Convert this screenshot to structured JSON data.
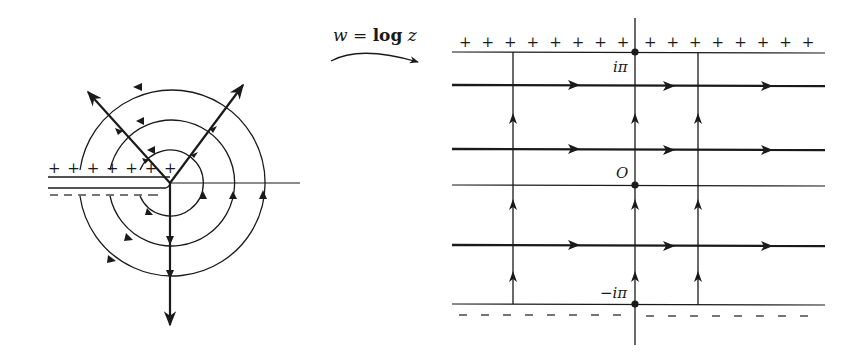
{
  "diagram": {
    "colors": {
      "ink": "#1a1a1a",
      "background": "#ffffff"
    }
  },
  "mapping": {
    "label_w": "w",
    "label_eq": " = ",
    "label_log": "log",
    "label_z": "z"
  },
  "z_plane": {
    "center": [
      170,
      183
    ],
    "circle_radii": [
      33,
      63,
      93
    ],
    "rays": [
      {
        "name": "upper-left-ray",
        "to": [
          88,
          92
        ]
      },
      {
        "name": "upper-right-ray",
        "to": [
          243,
          85
        ]
      },
      {
        "name": "downward-ray",
        "to": [
          170,
          325
        ]
      }
    ],
    "upper_cut_signs": "+ + + + + + +",
    "lower_cut_signs": "– – – – – – –",
    "plus_count": 7,
    "minus_count": 7
  },
  "w_plane": {
    "labels": {
      "top": "iπ",
      "origin": "O",
      "bottom": "−iπ"
    },
    "top_plus_left": "+ + + + + + + +",
    "top_plus_right": "+ + + + + + + +",
    "plus_count_left": 8,
    "plus_count_right": 8,
    "minus_count": 16,
    "horizontal_lines": [
      {
        "y": 52,
        "weight": "thin",
        "role": "upper-boundary-iπ"
      },
      {
        "y": 85,
        "weight": "bold",
        "role": "streamline"
      },
      {
        "y": 150,
        "weight": "bold",
        "role": "streamline"
      },
      {
        "y": 185,
        "weight": "thin",
        "role": "real-axis"
      },
      {
        "y": 245,
        "weight": "bold",
        "role": "streamline"
      },
      {
        "y": 305,
        "weight": "thin",
        "role": "lower-boundary-−iπ"
      }
    ],
    "vertical_lines_x": [
      513,
      635,
      698
    ]
  }
}
